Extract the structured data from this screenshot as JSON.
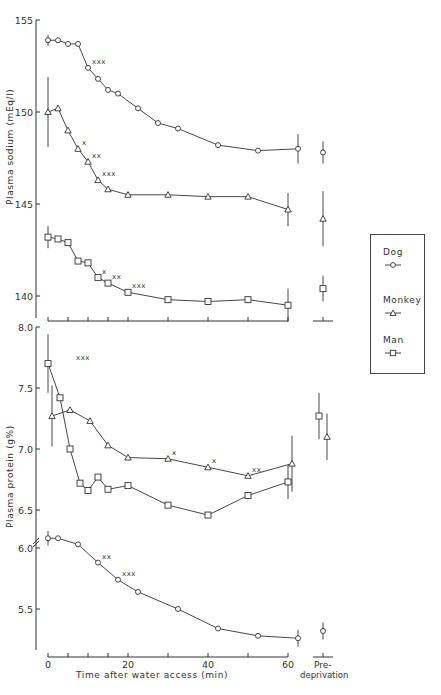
{
  "chart_data": [
    {
      "type": "line",
      "title": "",
      "ylabel": "Plasma sodium (mEq/l)",
      "xlabel": "Time after water access (min)",
      "ylim": [
        139.5,
        155
      ],
      "yticks": [
        140,
        145,
        150,
        155
      ],
      "grid": false,
      "series": [
        {
          "name": "Dog",
          "marker": "circle",
          "x": [
            0,
            2.5,
            5,
            7.5,
            10,
            12.5,
            15,
            17.5,
            22.5,
            27.5,
            32.5,
            42.5,
            52.5,
            62.5
          ],
          "y": [
            153.9,
            153.9,
            153.7,
            153.7,
            152.4,
            151.8,
            151.2,
            151.0,
            150.2,
            149.4,
            149.1,
            148.2,
            147.9,
            148.0
          ],
          "err_x": [
            0,
            62.5
          ],
          "err": [
            0.3,
            0.8
          ],
          "significance": [
            {
              "x": 10,
              "label": "xxx"
            }
          ],
          "predeprivation": {
            "y": 147.8,
            "err": 0.6
          }
        },
        {
          "name": "Monkey",
          "marker": "triangle",
          "x": [
            0,
            2.5,
            5,
            7.5,
            10,
            12.5,
            15,
            20,
            30,
            40,
            50,
            60
          ],
          "y": [
            150.0,
            150.2,
            149.0,
            148.0,
            147.3,
            146.3,
            145.8,
            145.5,
            145.5,
            145.4,
            145.4,
            144.7
          ],
          "err_x": [
            0,
            60
          ],
          "err": [
            1.9,
            0.9
          ],
          "significance": [
            {
              "x": 7.5,
              "label": "x"
            },
            {
              "x": 10,
              "label": "xx"
            },
            {
              "x": 12.5,
              "label": "xxx"
            }
          ],
          "predeprivation": {
            "y": 144.2,
            "err": 1.5
          }
        },
        {
          "name": "Man",
          "marker": "square",
          "x": [
            0,
            2.5,
            5,
            7.5,
            10,
            12.5,
            15,
            20,
            30,
            40,
            50,
            60
          ],
          "y": [
            143.2,
            143.1,
            142.9,
            141.9,
            141.8,
            141.0,
            140.7,
            140.2,
            139.8,
            139.7,
            139.8,
            139.5
          ],
          "err_x": [
            0,
            60
          ],
          "err": [
            0.6,
            0.9
          ],
          "significance": [
            {
              "x": 12.5,
              "label": "x"
            },
            {
              "x": 15,
              "label": "xx"
            },
            {
              "x": 20,
              "label": "xxx"
            }
          ],
          "predeprivation": {
            "y": 140.4,
            "err": 0.7
          }
        }
      ]
    },
    {
      "type": "line",
      "title": "",
      "ylabel": "Plasma protein (g%)",
      "xlabel": "Time after water access (min)",
      "ylim": [
        5.2,
        8.0
      ],
      "yticks": [
        5.5,
        6.0,
        6.5,
        7.0,
        7.5,
        8.0
      ],
      "axis_break_between": [
        6.0,
        6.5
      ],
      "grid": false,
      "series": [
        {
          "name": "Dog",
          "marker": "circle",
          "x": [
            0,
            2.5,
            7.5,
            12.5,
            17.5,
            22.5,
            32.5,
            42.5,
            52.5,
            62.5
          ],
          "y": [
            6.08,
            6.08,
            6.03,
            5.88,
            5.74,
            5.64,
            5.5,
            5.34,
            5.28,
            5.26
          ],
          "err_x": [
            0,
            62.5
          ],
          "err": [
            0.06,
            0.07
          ],
          "significance": [
            {
              "x": 12.5,
              "label": "xx"
            },
            {
              "x": 17.5,
              "label": "xxx"
            }
          ],
          "predeprivation": {
            "y": 5.32,
            "err": 0.07
          }
        },
        {
          "name": "Monkey",
          "marker": "triangle",
          "x": [
            1,
            5.5,
            10.5,
            15,
            20,
            30,
            40,
            50,
            61
          ],
          "y": [
            7.27,
            7.32,
            7.23,
            7.03,
            6.93,
            6.92,
            6.85,
            6.78,
            6.88
          ],
          "err_x": [
            1,
            61
          ],
          "err": [
            0.25,
            0.23
          ],
          "significance": [
            {
              "x": 30,
              "label": "x"
            },
            {
              "x": 40,
              "label": "x"
            },
            {
              "x": 50,
              "label": "xx"
            }
          ],
          "predeprivation": {
            "y": 7.1,
            "err": 0.19
          }
        },
        {
          "name": "Man",
          "marker": "square",
          "x": [
            0,
            3,
            5.5,
            8,
            10,
            12.5,
            15,
            20,
            30,
            40,
            50,
            60
          ],
          "y": [
            7.7,
            7.42,
            7.0,
            6.72,
            6.66,
            6.77,
            6.67,
            6.7,
            6.54,
            6.27,
            6.43,
            6.73
          ],
          "err_x": [
            0,
            60
          ],
          "err": [
            0.24,
            0.14
          ],
          "significance": [
            {
              "x": 6,
              "label": "xxx"
            }
          ],
          "predeprivation": {
            "y": 7.27,
            "err": 0.19
          }
        }
      ]
    }
  ],
  "axes": {
    "x_ticks": [
      0,
      5,
      10,
      15,
      20,
      30,
      40,
      50,
      60
    ],
    "x_tick_labels": [
      "0",
      "20",
      "40",
      "60"
    ],
    "x_label_values": [
      0,
      20,
      40,
      60
    ],
    "predeprivation_label_1": "Pre-",
    "predeprivation_label_2": "deprivation",
    "x_title": "Time after water access (min)",
    "y_title_sodium": "Plasma sodium (mEq/l)",
    "y_title_protein": "Plasma protein (g%)",
    "sodium_tick_labels": [
      "155",
      "150",
      "145",
      "140"
    ],
    "protein_tick_labels": [
      "8.0",
      "7.5",
      "7.0",
      "6.5",
      "6.0",
      "5.5"
    ]
  },
  "legend": {
    "items": [
      {
        "label": "Dog",
        "marker": "circle"
      },
      {
        "label": "Monkey",
        "marker": "triangle"
      },
      {
        "label": "Man",
        "marker": "square"
      }
    ]
  }
}
